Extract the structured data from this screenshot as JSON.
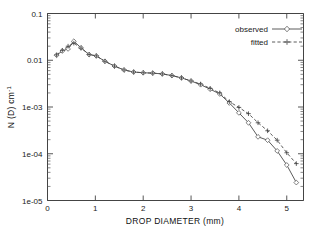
{
  "figure": {
    "background_color": "#ffffff",
    "line_color": "#4a4a4a",
    "text_color": "#1a1a1a"
  },
  "chart_data": {
    "type": "line",
    "title": "",
    "xlabel": "DROP  DIAMETER (mm)",
    "ylabel": "N (D) cm",
    "ylabel_exponent": "-1",
    "xlim": [
      0,
      5.35
    ],
    "ylim": [
      1e-05,
      0.1
    ],
    "yscale": "log",
    "xscale": "linear",
    "grid": false,
    "legend_position": "top-right",
    "xticks": [
      0,
      1,
      2,
      3,
      4,
      5
    ],
    "xticklabels": [
      "0",
      "1",
      "2",
      "3",
      "4",
      "5"
    ],
    "yticks": [
      0.1,
      0.01,
      0.001,
      0.0001,
      1e-05
    ],
    "yticklabels": [
      "0.1",
      "0.01",
      "1e-03",
      "1e-04",
      "1e-05"
    ],
    "series": [
      {
        "name": "observed",
        "linestyle": "solid",
        "marker": "diamond",
        "x": [
          0.19,
          0.31,
          0.43,
          0.55,
          0.7,
          0.87,
          1.02,
          1.2,
          1.4,
          1.6,
          1.8,
          2.0,
          2.2,
          2.4,
          2.6,
          2.8,
          3.0,
          3.2,
          3.4,
          3.6,
          3.8,
          4.0,
          4.2,
          4.4,
          4.6,
          4.8,
          5.0,
          5.2
        ],
        "y": [
          0.0128,
          0.0158,
          0.0175,
          0.0255,
          0.0185,
          0.0132,
          0.0124,
          0.0095,
          0.0075,
          0.0062,
          0.0056,
          0.0054,
          0.0053,
          0.0051,
          0.0047,
          0.0042,
          0.0036,
          0.003,
          0.0024,
          0.0019,
          0.00122,
          0.00075,
          0.00046,
          0.00023,
          0.000195,
          0.000115,
          5.75e-05,
          2.42e-05
        ]
      },
      {
        "name": "fitted",
        "linestyle": "dashed",
        "marker": "plus",
        "x": [
          0.19,
          0.31,
          0.43,
          0.55,
          0.7,
          0.87,
          1.02,
          1.2,
          1.4,
          1.6,
          1.8,
          2.0,
          2.2,
          2.4,
          2.6,
          2.8,
          3.0,
          3.2,
          3.4,
          3.6,
          3.8,
          4.0,
          4.2,
          4.4,
          4.6,
          4.8,
          5.0,
          5.2
        ],
        "y": [
          0.013,
          0.0163,
          0.02,
          0.0232,
          0.0182,
          0.0133,
          0.0124,
          0.0095,
          0.0075,
          0.0062,
          0.0056,
          0.0054,
          0.0053,
          0.0051,
          0.0047,
          0.0042,
          0.0036,
          0.0031,
          0.0025,
          0.002,
          0.0013,
          0.00098,
          0.00072,
          0.00046,
          0.00031,
          0.000195,
          0.000105,
          6.15e-05
        ]
      }
    ]
  },
  "legend": {
    "entries": [
      {
        "label": "observed"
      },
      {
        "label": "fitted"
      }
    ]
  }
}
